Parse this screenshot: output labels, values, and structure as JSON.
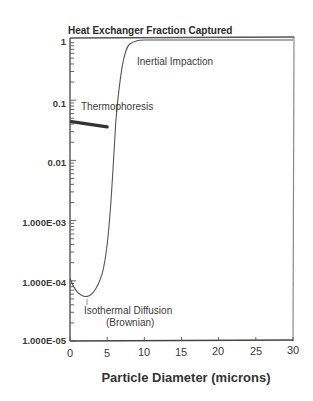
{
  "chart_data": {
    "type": "line",
    "title": "Heat Exchanger Fraction Captured",
    "xlabel": "Particle Diameter (microns)",
    "ylabel": "",
    "xlim": [
      0,
      30
    ],
    "ylim": [
      1e-05,
      1
    ],
    "yscale": "log",
    "grid": false,
    "x_ticks": [
      "0",
      "5",
      "10",
      "15",
      "20",
      "25",
      "30"
    ],
    "y_ticks": [
      "1.000E-05",
      "1.000E-04",
      "1.000E-03",
      "0.01",
      "0.1",
      "1"
    ],
    "series": [
      {
        "name": "Total capture (Isothermal Diffusion + Inertial Impaction)",
        "x": [
          0,
          0.5,
          1,
          1.5,
          2,
          2.5,
          3,
          3.5,
          4,
          4.5,
          5,
          5.5,
          6,
          6.2,
          6.5,
          7,
          7.5,
          8,
          9,
          10,
          15,
          20,
          25,
          30
        ],
        "y": [
          0.00011,
          8e-05,
          6.5e-05,
          5.8e-05,
          5.5e-05,
          5.6e-05,
          6.2e-05,
          7.5e-05,
          0.0001,
          0.00016,
          0.0004,
          0.002,
          0.02,
          0.05,
          0.12,
          0.35,
          0.65,
          0.85,
          0.97,
          1.0,
          1.0,
          1.0,
          1.0,
          1.0
        ]
      },
      {
        "name": "Thermophoresis",
        "x": [
          0.2,
          5
        ],
        "y": [
          0.044,
          0.036
        ]
      }
    ],
    "annotations": [
      {
        "text": "Inertial Impaction",
        "x": 10.5,
        "y": 0.45
      },
      {
        "text": "Thermophoresis",
        "x": 1.3,
        "y": 0.08
      },
      {
        "text": "Isothermal Diffusion",
        "x": 1.2,
        "y": 3.2e-05
      },
      {
        "text": "(Brownian)",
        "x": 3.8,
        "y": 2e-05
      }
    ]
  },
  "labels": {
    "title": "Heat Exchanger Fraction Captured",
    "xlabel": "Particle Diameter (microns)",
    "inertial": "Inertial Impaction",
    "thermo": "Thermophoresis",
    "iso1": "Isothermal Diffusion",
    "iso2": "(Brownian)",
    "xticks": [
      "0",
      "5",
      "10",
      "15",
      "20",
      "25",
      "30"
    ],
    "yticks": [
      "1.000E-05",
      "1.000E-04",
      "1.000E-03",
      "0.01",
      "0.1",
      "1"
    ]
  }
}
